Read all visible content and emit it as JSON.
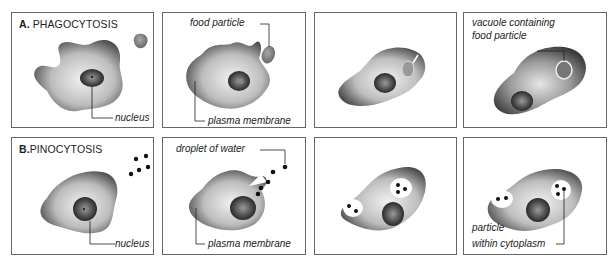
{
  "figure": {
    "rows": [
      {
        "id": "A",
        "letter": "A.",
        "title": "PHAGOCYTOSIS",
        "panels": [
          {
            "step": 1,
            "labels": {
              "nucleus": "nucleus"
            }
          },
          {
            "step": 2,
            "labels": {
              "food_particle": "food particle",
              "plasma_membrane": "plasma membrane"
            }
          },
          {
            "step": 3,
            "labels": {}
          },
          {
            "step": 4,
            "labels": {
              "vacuole_line1": "vacuole containing",
              "vacuole_line2": "food particle"
            }
          }
        ]
      },
      {
        "id": "B",
        "letter": "B.",
        "title": "PINOCYTOSIS",
        "panels": [
          {
            "step": 1,
            "labels": {
              "nucleus": "nucleus"
            }
          },
          {
            "step": 2,
            "labels": {
              "droplet": "droplet of water",
              "plasma_membrane": "plasma membrane"
            }
          },
          {
            "step": 3,
            "labels": {}
          },
          {
            "step": 4,
            "labels": {
              "particle_line1": "particle",
              "particle_line2": "within cytoplasm"
            }
          }
        ]
      }
    ],
    "colors": {
      "border": "#666666",
      "cell_edge": "#4a4a4a",
      "cell_center": "#e8e8e8",
      "nucleus": "#3a3a3a",
      "droplet": "#111111"
    }
  }
}
